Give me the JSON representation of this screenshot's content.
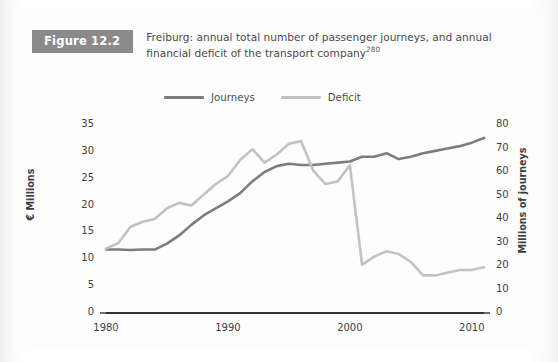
{
  "figure": {
    "badge": "Figure 12.2",
    "caption_main": "Freiburg: annual total number of passenger journeys, and annual financial deficit of the transport company",
    "caption_superscript": "280"
  },
  "legend": {
    "position": "top-center",
    "items": [
      {
        "label": "Journeys",
        "color": "#7d7d7d",
        "name": "legend-journeys"
      },
      {
        "label": "Deficit",
        "color": "#c2c2c2",
        "name": "legend-deficit"
      }
    ]
  },
  "axes": {
    "left": {
      "title": "€ Millions",
      "ticks": [
        "0",
        "5",
        "10",
        "15",
        "20",
        "25",
        "30",
        "35"
      ],
      "min": 0,
      "max": 35
    },
    "right": {
      "title": "Millions of journeys",
      "ticks": [
        "0",
        "10",
        "20",
        "30",
        "40",
        "50",
        "60",
        "70",
        "80"
      ],
      "min": 0,
      "max": 80
    },
    "x": {
      "ticks": [
        "1980",
        "1990",
        "2000",
        "2010"
      ],
      "min": 1980,
      "max": 2011
    }
  },
  "chart_data": {
    "type": "line",
    "title": "Freiburg: annual total number of passenger journeys, and annual financial deficit of the transport company",
    "xlabel": "",
    "ylabel": "€ Millions",
    "y2label": "Millions of journeys",
    "grid": false,
    "legend_position": "top-center",
    "xlim": [
      1980,
      2011
    ],
    "ylim": [
      0,
      35
    ],
    "y2lim": [
      0,
      80
    ],
    "xticks": [
      1980,
      1990,
      2000,
      2010
    ],
    "yticks": [
      0,
      5,
      10,
      15,
      20,
      25,
      30,
      35
    ],
    "y2ticks": [
      0,
      10,
      20,
      30,
      40,
      50,
      60,
      70,
      80
    ],
    "x": [
      1980,
      1981,
      1982,
      1983,
      1984,
      1985,
      1986,
      1987,
      1988,
      1989,
      1990,
      1991,
      1992,
      1993,
      1994,
      1995,
      1996,
      1997,
      1998,
      1999,
      2000,
      2001,
      2002,
      2003,
      2004,
      2005,
      2006,
      2007,
      2008,
      2009,
      2010,
      2011
    ],
    "series": [
      {
        "name": "Journeys",
        "color": "#7d7d7d",
        "axis": "right",
        "unit": "millions of journeys",
        "values": [
          27.0,
          27.0,
          26.8,
          27.0,
          27.0,
          29.5,
          33.0,
          37.5,
          41.5,
          44.5,
          47.5,
          51.0,
          56.0,
          60.0,
          62.5,
          63.5,
          63.0,
          63.0,
          63.5,
          64.0,
          64.5,
          66.5,
          66.5,
          68.0,
          65.5,
          66.5,
          68.0,
          69.0,
          70.0,
          71.0,
          72.5,
          74.5
        ]
      },
      {
        "name": "Deficit",
        "color": "#c2c2c2",
        "axis": "left",
        "unit": "€ millions",
        "values": [
          12.0,
          13.0,
          16.0,
          17.0,
          17.5,
          19.5,
          20.5,
          20.0,
          22.0,
          24.0,
          25.5,
          28.5,
          30.5,
          28.0,
          29.5,
          31.5,
          32.0,
          26.5,
          24.0,
          24.5,
          27.5,
          9.0,
          10.5,
          11.5,
          11.0,
          9.5,
          7.0,
          7.0,
          7.5,
          8.0,
          8.0,
          8.5
        ]
      }
    ]
  }
}
